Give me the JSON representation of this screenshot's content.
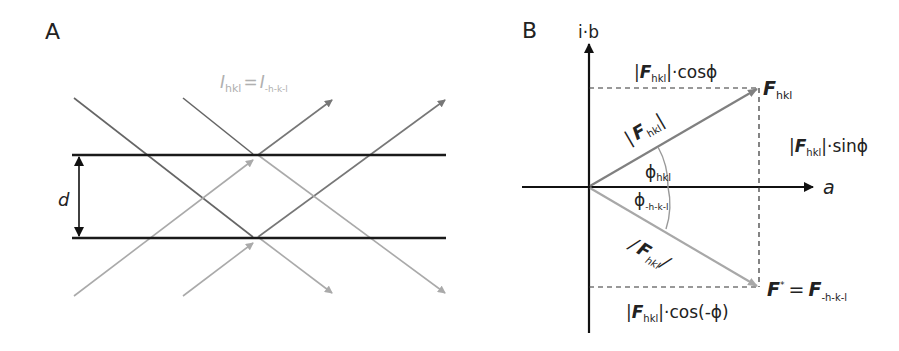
{
  "panel_a": {
    "label": "A",
    "intensity_eq": {
      "I1": "I",
      "sub1": "hkl",
      "eq": "=",
      "I2": "I",
      "sub2": "-h-k-l"
    },
    "spacing_label": "d",
    "colors": {
      "planes": "#1a1a1a",
      "incident": "#666666",
      "diffracted_dark": "#777777",
      "diffracted_light": "#aaaaaa",
      "eq_text": "#b0b0b0"
    }
  },
  "panel_b": {
    "label": "B",
    "axis_y": "i·b",
    "axis_x": "a",
    "F_top": {
      "F": "F",
      "sub": "hkl"
    },
    "F_bottom": {
      "F": "F",
      "star": "*",
      "eq": "=",
      "F2": "F",
      "sub": "-h-k-l"
    },
    "mag_top": {
      "bar1": "|",
      "F": "F",
      "sub": "hkl",
      "bar2": "|"
    },
    "mag_bottom": {
      "bar1": "/",
      "F": "F",
      "sub": "hkl",
      "bar2": "/"
    },
    "phi_top": {
      "phi": "ϕ",
      "sub": "hkl"
    },
    "phi_bottom": {
      "phi": "ϕ",
      "sub": "-h-k-l"
    },
    "cos_top": {
      "bar1": "|",
      "F": "F",
      "sub": "hkl",
      "rest": "|·cosϕ"
    },
    "sin_right": {
      "bar1": "|",
      "F": "F",
      "sub": "hkl",
      "rest": "|·sinϕ"
    },
    "cos_bottom": {
      "bar1": "|",
      "F": "F",
      "sub": "hkl",
      "rest": "|·cos(-ϕ)"
    },
    "colors": {
      "axes": "#111111",
      "vec_top": "#808080",
      "vec_bottom": "#a8a8a8",
      "dashes": "#333333"
    }
  }
}
